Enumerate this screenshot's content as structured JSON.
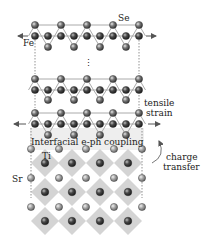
{
  "labels": {
    "se": "Se",
    "fe": "Fe",
    "ellipsis": "⋮",
    "tensile_line1": "tensile",
    "tensile_line2": "strain",
    "interfacial": "Interfacial e-ph coupling",
    "ti": "Ti",
    "sr": "Sr",
    "charge_line1": "charge",
    "charge_line2": "transfer"
  },
  "colors": {
    "fe_atom": "#3a3a3a",
    "se_atom": "#6e6e6e",
    "ti_atom": "#2e2e2e",
    "sr_atom": "#9a9a9a",
    "octahedron": "#d6d6d6",
    "bond": "#9a9a9a",
    "interface_shade": "#ececec"
  },
  "structure": {
    "layers": [
      {
        "name": "FeSe-top",
        "se_top_y": 25,
        "fe_y": 36,
        "se_bottom_y": 47
      },
      {
        "name": "FeSe-middle",
        "se_top_y": 79,
        "fe_y": 90,
        "se_bottom_y": 100
      },
      {
        "name": "FeSe-interface",
        "se_top_y": 113,
        "fe_y": 124,
        "se_bottom_y": 135
      }
    ],
    "substrate": "SrTiO3",
    "sr_rows_y": [
      149,
      178,
      207
    ],
    "ti_rows_y": [
      163,
      192,
      221
    ]
  }
}
